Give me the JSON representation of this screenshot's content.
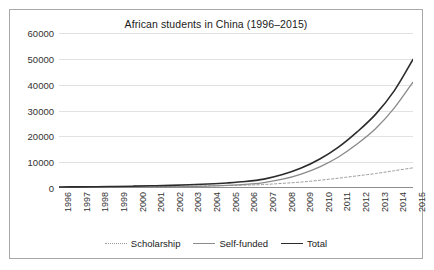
{
  "chart_data": {
    "type": "line",
    "title": "African students in China (1996–2015)",
    "xlabel": "",
    "ylabel": "",
    "ylim": [
      0,
      60000
    ],
    "ytick_labels": [
      "60000",
      "50000",
      "40000",
      "30000",
      "20000",
      "10000",
      "0"
    ],
    "ytick_values": [
      60000,
      50000,
      40000,
      30000,
      20000,
      10000,
      0
    ],
    "grid": true,
    "legend_position": "bottom",
    "categories": [
      "1996",
      "1997",
      "1998",
      "1999",
      "2000",
      "2001",
      "2002",
      "2003",
      "2004",
      "2005",
      "2006",
      "2007",
      "2008",
      "2009",
      "2010",
      "2011",
      "2012",
      "2013",
      "2014",
      "2015"
    ],
    "series": [
      {
        "name": "Scholarship",
        "style": "dotted",
        "color": "#9a9a9a",
        "values": [
          300,
          320,
          350,
          400,
          450,
          520,
          600,
          700,
          820,
          950,
          1100,
          1350,
          1800,
          2300,
          3000,
          3800,
          4700,
          5600,
          6700,
          7800
        ]
      },
      {
        "name": "Self-funded",
        "style": "solid",
        "color": "#8a8a8a",
        "values": [
          100,
          120,
          150,
          200,
          260,
          340,
          430,
          560,
          750,
          1000,
          1400,
          2100,
          3400,
          5400,
          8200,
          12000,
          17000,
          23000,
          31000,
          41000
        ]
      },
      {
        "name": "Total",
        "style": "solid",
        "color": "#2b2b2b",
        "values": [
          400,
          440,
          500,
          600,
          710,
          860,
          1030,
          1260,
          1570,
          1950,
          2500,
          3450,
          5200,
          7700,
          11200,
          15800,
          21700,
          28600,
          37700,
          49800
        ]
      }
    ]
  },
  "legend": {
    "items": [
      {
        "label": "Scholarship"
      },
      {
        "label": "Self-funded"
      },
      {
        "label": "Total"
      }
    ]
  }
}
